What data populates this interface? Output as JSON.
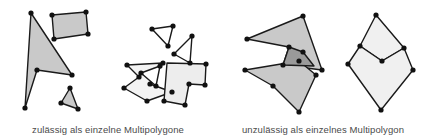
{
  "figure": {
    "background_color": "#ffffff",
    "width": 431,
    "height": 137
  },
  "captions": {
    "left": "zulässig als einzelne Multipolygone",
    "right": "unzulässig als einzelnes Multipolygon",
    "color": "#4a4a4a",
    "font_size_px": 9.5
  },
  "style": {
    "stroke_color": "#1a1a1a",
    "stroke_width": 1.4,
    "vertex_color": "#111111",
    "vertex_radius": 2.6,
    "fill_medium_gray": "#c9c9c9",
    "fill_light_gray": "#ededed",
    "fill_dark_gray": "#9a9a9a",
    "fill_white": "#ffffff"
  },
  "groups": [
    {
      "name": "group-left-disjoint",
      "label": "zulässig als einzelne Multipolygone",
      "shapes": [
        {
          "name": "arrow-polygon",
          "fill": "#c9c9c9",
          "points": "31,13 72,75 37,70 25,108"
        },
        {
          "name": "quadrilateral-polygon",
          "fill": "#c9c9c9",
          "points": "52,15 86,12 88,34 54,39"
        },
        {
          "name": "small-triangle-polygon",
          "fill": "#c9c9c9",
          "points": "70,88 78,109 61,103"
        }
      ]
    },
    {
      "name": "group-middle-touching",
      "label": "zulässig als einzelne Multipolygone",
      "shapes": [
        {
          "name": "upper-left-triangle",
          "fill": "#ffffff",
          "points": "152,29 173,26 168,46"
        },
        {
          "name": "upper-right-triangle",
          "fill": "#ffffff",
          "points": "192,36 174,54 190,63"
        },
        {
          "name": "zigzag-arrow-polygon",
          "fill": "#f3f3f3",
          "points": "127,65 163,63 150,84 172,92 147,101 124,88 139,77"
        },
        {
          "name": "inner-triangle-polygon",
          "fill": "#ffffff",
          "points": "141,73 160,66 156,86"
        },
        {
          "name": "right-quad-polygon",
          "fill": "#ededed",
          "points": "167,63 206,64 205,85 189,84 185,105 164,101"
        }
      ]
    },
    {
      "name": "group-right-overlapping",
      "label": "unzulässig als einzelnes Multipolygon",
      "shapes": [
        {
          "name": "upper-overlapping-polygon",
          "fill": "#c9c9c9",
          "points": "247,39 303,16 322,70 283,65 289,47"
        },
        {
          "name": "lower-overlapping-polygon",
          "fill": "#c9c9c9",
          "points": "245,70 299,61 316,75 299,112 273,86"
        },
        {
          "name": "overlap-region-polygon",
          "fill": "#9a9a9a",
          "points": "303,52 314,66 283,65 289,47"
        }
      ]
    },
    {
      "name": "group-right-shared-edge",
      "label": "unzulässig als einzelnes Multipolygon",
      "shapes": [
        {
          "name": "upper-shared-polygon",
          "fill": "#f0f0f0",
          "points": "376,15 404,48 382,61 360,46"
        },
        {
          "name": "lower-shared-polygon",
          "fill": "#f0f0f0",
          "points": "360,46 382,61 404,48 413,70 381,110 348,64"
        }
      ]
    }
  ],
  "vertices": [
    {
      "group": "group-left-disjoint",
      "x": 31,
      "y": 13
    },
    {
      "group": "group-left-disjoint",
      "x": 72,
      "y": 75
    },
    {
      "group": "group-left-disjoint",
      "x": 37,
      "y": 70
    },
    {
      "group": "group-left-disjoint",
      "x": 25,
      "y": 108
    },
    {
      "group": "group-left-disjoint",
      "x": 52,
      "y": 15
    },
    {
      "group": "group-left-disjoint",
      "x": 86,
      "y": 12
    },
    {
      "group": "group-left-disjoint",
      "x": 88,
      "y": 34
    },
    {
      "group": "group-left-disjoint",
      "x": 54,
      "y": 39
    },
    {
      "group": "group-left-disjoint",
      "x": 70,
      "y": 88
    },
    {
      "group": "group-left-disjoint",
      "x": 78,
      "y": 109
    },
    {
      "group": "group-left-disjoint",
      "x": 61,
      "y": 103
    },
    {
      "group": "group-middle-touching",
      "x": 152,
      "y": 29
    },
    {
      "group": "group-middle-touching",
      "x": 173,
      "y": 26
    },
    {
      "group": "group-middle-touching",
      "x": 168,
      "y": 46
    },
    {
      "group": "group-middle-touching",
      "x": 192,
      "y": 36
    },
    {
      "group": "group-middle-touching",
      "x": 174,
      "y": 54
    },
    {
      "group": "group-middle-touching",
      "x": 190,
      "y": 63
    },
    {
      "group": "group-middle-touching",
      "x": 127,
      "y": 65
    },
    {
      "group": "group-middle-touching",
      "x": 163,
      "y": 63
    },
    {
      "group": "group-middle-touching",
      "x": 150,
      "y": 84
    },
    {
      "group": "group-middle-touching",
      "x": 172,
      "y": 92
    },
    {
      "group": "group-middle-touching",
      "x": 147,
      "y": 101
    },
    {
      "group": "group-middle-touching",
      "x": 124,
      "y": 88
    },
    {
      "group": "group-middle-touching",
      "x": 139,
      "y": 77
    },
    {
      "group": "group-middle-touching",
      "x": 141,
      "y": 73
    },
    {
      "group": "group-middle-touching",
      "x": 160,
      "y": 66
    },
    {
      "group": "group-middle-touching",
      "x": 156,
      "y": 86
    },
    {
      "group": "group-middle-touching",
      "x": 206,
      "y": 64
    },
    {
      "group": "group-middle-touching",
      "x": 205,
      "y": 85
    },
    {
      "group": "group-middle-touching",
      "x": 189,
      "y": 84
    },
    {
      "group": "group-middle-touching",
      "x": 185,
      "y": 105
    },
    {
      "group": "group-middle-touching",
      "x": 164,
      "y": 101
    },
    {
      "group": "group-right-overlapping",
      "x": 247,
      "y": 39
    },
    {
      "group": "group-right-overlapping",
      "x": 303,
      "y": 16
    },
    {
      "group": "group-right-overlapping",
      "x": 322,
      "y": 70
    },
    {
      "group": "group-right-overlapping",
      "x": 283,
      "y": 65
    },
    {
      "group": "group-right-overlapping",
      "x": 289,
      "y": 47
    },
    {
      "group": "group-right-overlapping",
      "x": 245,
      "y": 70
    },
    {
      "group": "group-right-overlapping",
      "x": 299,
      "y": 61
    },
    {
      "group": "group-right-overlapping",
      "x": 316,
      "y": 75
    },
    {
      "group": "group-right-overlapping",
      "x": 299,
      "y": 112
    },
    {
      "group": "group-right-overlapping",
      "x": 273,
      "y": 86
    },
    {
      "group": "group-right-overlapping",
      "x": 303,
      "y": 52
    },
    {
      "group": "group-right-shared-edge",
      "x": 376,
      "y": 15
    },
    {
      "group": "group-right-shared-edge",
      "x": 404,
      "y": 48
    },
    {
      "group": "group-right-shared-edge",
      "x": 382,
      "y": 61
    },
    {
      "group": "group-right-shared-edge",
      "x": 360,
      "y": 46
    },
    {
      "group": "group-right-shared-edge",
      "x": 413,
      "y": 70
    },
    {
      "group": "group-right-shared-edge",
      "x": 381,
      "y": 110
    },
    {
      "group": "group-right-shared-edge",
      "x": 348,
      "y": 64
    }
  ]
}
